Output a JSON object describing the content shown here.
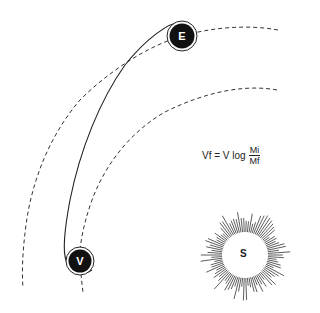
{
  "diagram": {
    "bodies": [
      {
        "id": "earth",
        "label": "E",
        "cx": 182,
        "cy": 36
      },
      {
        "id": "venus",
        "label": "V",
        "cx": 80,
        "cy": 261
      },
      {
        "id": "sun",
        "label": "S",
        "cx": 245,
        "cy": 255
      }
    ],
    "formula": {
      "lhs": "Vf = V log",
      "numerator": "Mi",
      "denominator": "Mf"
    },
    "paths": {
      "earth_orbit": "dashed",
      "venus_orbit": "dashed",
      "transfer_trajectory": "solid"
    },
    "colors": {
      "ink": "#1a1a1a",
      "background": "#ffffff"
    }
  }
}
